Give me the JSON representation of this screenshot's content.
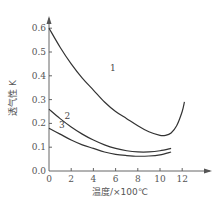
{
  "chart_data": {
    "type": "line",
    "title": "",
    "xlabel": "温度/×100℃",
    "ylabel": "透气性 K",
    "xlim": [
      0,
      13
    ],
    "ylim": [
      0,
      0.65
    ],
    "x_ticks": [
      "0",
      "2",
      "4",
      "6",
      "8",
      "10",
      "12"
    ],
    "y_ticks": [
      "0.0",
      "0.1",
      "0.2",
      "0.3",
      "0.4",
      "0.5",
      "0.6"
    ],
    "grid": false,
    "legend": "none",
    "series": [
      {
        "name": "1",
        "x": [
          0,
          1,
          2,
          3,
          4,
          5,
          6,
          7,
          8,
          9,
          10,
          10.5,
          11,
          11.5,
          12,
          12.2
        ],
        "y": [
          0.6,
          0.52,
          0.45,
          0.39,
          0.34,
          0.29,
          0.25,
          0.22,
          0.19,
          0.165,
          0.15,
          0.15,
          0.16,
          0.19,
          0.25,
          0.29
        ]
      },
      {
        "name": "2",
        "x": [
          0,
          1,
          2,
          3,
          4,
          5,
          6,
          7,
          8,
          9,
          10,
          11
        ],
        "y": [
          0.26,
          0.22,
          0.185,
          0.155,
          0.13,
          0.11,
          0.095,
          0.085,
          0.08,
          0.08,
          0.085,
          0.095
        ]
      },
      {
        "name": "3",
        "x": [
          0,
          1,
          2,
          3,
          4,
          5,
          6,
          7,
          8,
          9,
          10,
          11
        ],
        "y": [
          0.18,
          0.155,
          0.13,
          0.11,
          0.095,
          0.08,
          0.07,
          0.065,
          0.062,
          0.063,
          0.068,
          0.08
        ]
      }
    ],
    "curve_labels": [
      {
        "series": "1",
        "text": "1",
        "x": 5.5,
        "y": 0.42
      },
      {
        "series": "2",
        "text": "2",
        "x": 1.4,
        "y": 0.22
      },
      {
        "series": "3",
        "text": "3",
        "x": 0.9,
        "y": 0.18
      }
    ]
  }
}
